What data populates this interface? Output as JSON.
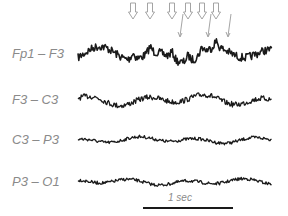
{
  "chart_data": {
    "type": "line",
    "title": "",
    "channels": [
      {
        "name": "Fp1 – F3",
        "baseline_y": 55,
        "amplitude": "large",
        "label_y": 46
      },
      {
        "name": "F3 – C3",
        "baseline_y": 100,
        "amplitude": "medium",
        "label_y": 92
      },
      {
        "name": "C3 – P3",
        "baseline_y": 140,
        "amplitude": "small",
        "label_y": 132
      },
      {
        "name": "P3 – O1",
        "baseline_y": 182,
        "amplitude": "small",
        "label_y": 174
      }
    ],
    "x_range_px": [
      78,
      272
    ],
    "scale_bar": {
      "label": "1 sec",
      "x_start": 143,
      "x_end": 233,
      "y": 208
    },
    "annotations": {
      "hollow_arrows_x": [
        133,
        150,
        172,
        188,
        202,
        216
      ],
      "thin_arrows_x": [
        180,
        208,
        228
      ]
    },
    "grid": false,
    "legend": "none"
  },
  "labels": {
    "ch1": "Fp1 – F3",
    "ch2": "F3 – C3",
    "ch3": "C3 – P3",
    "ch4": "P3 – O1",
    "scale": "1 sec"
  },
  "colors": {
    "trace": "#1a1a1a",
    "label": "#8a8a8a",
    "arrow": "#9a9a9a"
  }
}
